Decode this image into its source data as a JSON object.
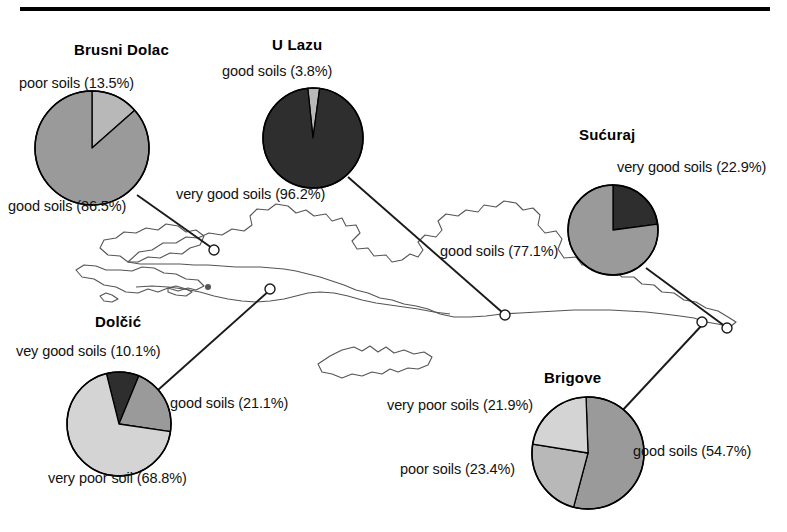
{
  "figure": {
    "top_rule_color": "#000000",
    "background_color": "#ffffff",
    "map_outline_color": "#555555",
    "leader_line_color": "#1a1a1a"
  },
  "palette": {
    "very_good": "#2e2e2e",
    "good": "#9a9a9a",
    "poor": "#b8b8b8",
    "very_poor": "#d4d4d4",
    "outline": "#000000"
  },
  "sites": [
    {
      "id": "brusni-dolac",
      "title": "Brusni Dolac",
      "labels": {
        "poor": "poor soils (13.5%)",
        "good": "good soils (86.5%)"
      }
    },
    {
      "id": "u-lazu",
      "title": "U Lazu",
      "labels": {
        "good": "good soils (3.8%)",
        "very_good": "very good soils (96.2%)"
      }
    },
    {
      "id": "sucuraj",
      "title": "Sućuraj",
      "labels": {
        "very_good": "very good soils (22.9%)",
        "good": "good soils (77.1%)"
      }
    },
    {
      "id": "dolcic",
      "title": "Dolčić",
      "labels": {
        "very_good": "vey good soils (10.1%)",
        "good": "good soils (21.1%)",
        "very_poor": "very poor soil (68.8%)"
      }
    },
    {
      "id": "brigove",
      "title": "Brigove",
      "labels": {
        "very_poor": "very poor soils (21.9%)",
        "poor": "poor soils (23.4%)",
        "good": "good soils (54.7%)"
      }
    }
  ],
  "chart_data": [
    {
      "type": "pie",
      "title": "Brusni Dolac",
      "categories": [
        "poor soils",
        "good soils"
      ],
      "values": [
        13.5,
        86.5
      ],
      "units": "%",
      "colors": [
        "#b8b8b8",
        "#9a9a9a"
      ],
      "center": [
        92,
        148
      ],
      "radius": 57,
      "start_angle_deg": 0
    },
    {
      "type": "pie",
      "title": "U Lazu",
      "categories": [
        "good soils",
        "very good soils"
      ],
      "values": [
        3.8,
        96.2
      ],
      "units": "%",
      "colors": [
        "#b8b8b8",
        "#2e2e2e"
      ],
      "center": [
        313,
        138
      ],
      "radius": 50,
      "start_angle_deg": -6
    },
    {
      "type": "pie",
      "title": "Sućuraj",
      "categories": [
        "very good soils",
        "good soils"
      ],
      "values": [
        22.9,
        77.1
      ],
      "units": "%",
      "colors": [
        "#2e2e2e",
        "#9a9a9a"
      ],
      "center": [
        613,
        230
      ],
      "radius": 45,
      "start_angle_deg": 0
    },
    {
      "type": "pie",
      "title": "Dolčić",
      "categories": [
        "vey good soils",
        "good soils",
        "very poor soil"
      ],
      "values": [
        10.1,
        21.1,
        68.8
      ],
      "units": "%",
      "colors": [
        "#2e2e2e",
        "#9a9a9a",
        "#d4d4d4"
      ],
      "center": [
        119,
        424
      ],
      "radius": 52,
      "start_angle_deg": -14
    },
    {
      "type": "pie",
      "title": "Brigove",
      "categories": [
        "good soils",
        "poor soils",
        "very poor soils"
      ],
      "values": [
        54.7,
        23.4,
        21.9
      ],
      "units": "%",
      "colors": [
        "#9a9a9a",
        "#b8b8b8",
        "#d4d4d4"
      ],
      "center": [
        588,
        453
      ],
      "radius": 56,
      "start_angle_deg": -2
    }
  ],
  "leader_lines": [
    {
      "site": "brusni-dolac",
      "from": [
        137,
        195
      ],
      "to": [
        212,
        248
      ]
    },
    {
      "site": "u-lazu",
      "from": [
        348,
        177
      ],
      "to": [
        503,
        313
      ]
    },
    {
      "site": "sucuraj",
      "from": [
        646,
        268
      ],
      "to": [
        726,
        327
      ]
    },
    {
      "site": "dolcic",
      "from": [
        158,
        390
      ],
      "to": [
        270,
        290
      ]
    },
    {
      "site": "brigove",
      "from": [
        621,
        412
      ],
      "to": [
        703,
        324
      ]
    }
  ]
}
